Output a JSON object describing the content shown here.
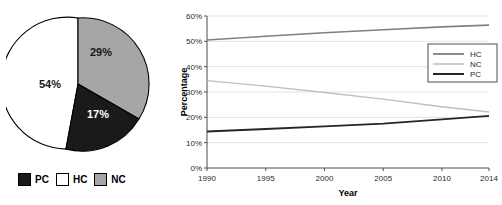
{
  "chart_data": [
    {
      "type": "pie",
      "title": "",
      "labels": [
        "HC",
        "NC",
        "PC"
      ],
      "values": [
        54,
        29,
        17
      ],
      "value_labels": [
        "54%",
        "29%",
        "17%"
      ],
      "colors": {
        "HC": "#ffffff",
        "NC": "#a6a6a6",
        "PC": "#1a1a1a"
      },
      "start_angle_deg": 0,
      "direction": "clockwise",
      "legend": {
        "position": "bottom",
        "entries": [
          {
            "label": "PC",
            "color": "#1a1a1a"
          },
          {
            "label": "HC",
            "color": "#ffffff"
          },
          {
            "label": "NC",
            "color": "#a6a6a6"
          }
        ]
      }
    },
    {
      "type": "line",
      "title": "",
      "xlabel": "Year",
      "ylabel": "Percentage",
      "x": [
        1990,
        2014
      ],
      "xlim": [
        1990,
        2014
      ],
      "ylim": [
        0,
        60
      ],
      "grid": true,
      "xticks": [
        1990,
        1995,
        2000,
        2005,
        2010,
        2014
      ],
      "xtick_labels": [
        "1990",
        "1995",
        "2000",
        "2005",
        "2010",
        "2014"
      ],
      "yticks": [
        0,
        10,
        20,
        30,
        40,
        50,
        60
      ],
      "ytick_labels": [
        "0%",
        "10%",
        "20%",
        "30%",
        "40%",
        "50%",
        "60%"
      ],
      "legend": {
        "position": "upper right",
        "entries": [
          "HC",
          "NC",
          "PC"
        ]
      },
      "series": [
        {
          "name": "HC",
          "color": "#808080",
          "width": 1.6,
          "points": [
            [
              1990,
              50.5
            ],
            [
              1995,
              52.0
            ],
            [
              2000,
              53.4
            ],
            [
              2005,
              54.6
            ],
            [
              2010,
              55.7
            ],
            [
              2014,
              56.4
            ]
          ]
        },
        {
          "name": "NC",
          "color": "#bfbfbf",
          "width": 1.4,
          "points": [
            [
              1990,
              34.5
            ],
            [
              1995,
              32.3
            ],
            [
              2000,
              29.8
            ],
            [
              2005,
              27.2
            ],
            [
              2010,
              24.2
            ],
            [
              2014,
              22.1
            ]
          ]
        },
        {
          "name": "PC",
          "color": "#262626",
          "width": 1.8,
          "points": [
            [
              1990,
              14.4
            ],
            [
              1995,
              15.4
            ],
            [
              2000,
              16.4
            ],
            [
              2005,
              17.5
            ],
            [
              2010,
              19.2
            ],
            [
              2014,
              20.6
            ]
          ]
        }
      ]
    }
  ],
  "pie": {
    "slice_hc_label": "54%",
    "slice_nc_label": "29%",
    "slice_pc_label": "17%",
    "legend": {
      "pc_label": "PC",
      "hc_label": "HC",
      "nc_label": "NC"
    }
  },
  "line": {
    "ylabel": "Percentage",
    "xlabel": "Year",
    "yticks": [
      "60%",
      "50%",
      "40%",
      "30%",
      "20%",
      "10%",
      "0%"
    ],
    "xticks": [
      "1990",
      "1995",
      "2000",
      "2005",
      "2010",
      "2014"
    ],
    "legend": {
      "hc_label": "HC",
      "nc_label": "NC",
      "pc_label": "PC"
    }
  },
  "colors": {
    "pie_hc": "#ffffff",
    "pie_nc": "#a6a6a6",
    "pie_pc": "#1a1a1a",
    "line_hc": "#808080",
    "line_nc": "#bfbfbf",
    "line_pc": "#262626",
    "grid": "#e3e3e3",
    "axis": "#4d4d4d"
  }
}
